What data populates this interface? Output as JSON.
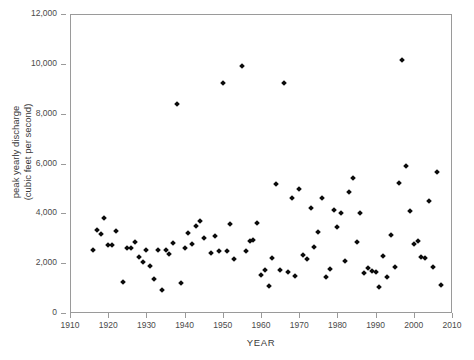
{
  "chart_data": {
    "type": "scatter",
    "title": "",
    "xlabel": "YEAR",
    "ylabel": "peak yearly discharge\n(cubic feet per second)",
    "xlim": [
      1910,
      2010
    ],
    "ylim": [
      0,
      12000
    ],
    "xticks": [
      1910,
      1920,
      1930,
      1940,
      1950,
      1960,
      1970,
      1980,
      1990,
      2000,
      2010
    ],
    "xtick_labels": [
      "1910",
      "1920",
      "1930",
      "1940",
      "1950",
      "1960",
      "1970",
      "1980",
      "1990",
      "2000",
      "2010"
    ],
    "yticks": [
      0,
      2000,
      4000,
      6000,
      8000,
      10000,
      12000
    ],
    "ytick_labels": [
      "0",
      "2,000",
      "4,000",
      "6,000",
      "8,000",
      "10,000",
      "12,000"
    ],
    "grid": false,
    "legend": null,
    "marker": "diamond",
    "marker_color": "#0b0b0b",
    "frame_color": "#9a9a9a",
    "background_color": "#ffffff",
    "series": [
      {
        "name": "peak yearly discharge",
        "x": [
          1916,
          1917,
          1918,
          1919,
          1920,
          1921,
          1922,
          1924,
          1925,
          1926,
          1927,
          1928,
          1929,
          1930,
          1931,
          1932,
          1933,
          1934,
          1935,
          1936,
          1937,
          1938,
          1939,
          1940,
          1941,
          1942,
          1943,
          1944,
          1945,
          1947,
          1948,
          1949,
          1950,
          1951,
          1952,
          1953,
          1955,
          1956,
          1957,
          1958,
          1959,
          1960,
          1961,
          1962,
          1963,
          1964,
          1965,
          1966,
          1967,
          1968,
          1969,
          1970,
          1971,
          1972,
          1973,
          1974,
          1975,
          1976,
          1977,
          1978,
          1979,
          1980,
          1981,
          1982,
          1983,
          1984,
          1985,
          1986,
          1987,
          1988,
          1989,
          1990,
          1991,
          1992,
          1993,
          1994,
          1995,
          1996,
          1997,
          1998,
          1999,
          2000,
          2001,
          2002,
          2003,
          2004,
          2005,
          2006,
          2007
        ],
        "y": [
          2520,
          3330,
          3180,
          3820,
          2720,
          2720,
          3280,
          1240,
          2620,
          2620,
          2830,
          2240,
          2050,
          2520,
          1880,
          1380,
          2540,
          940,
          2540,
          2380,
          2820,
          8400,
          1220,
          2620,
          3230,
          2780,
          3500,
          3700,
          3030,
          2420,
          3100,
          2480,
          9250,
          2480,
          3570,
          2180,
          9900,
          2480,
          2880,
          2920,
          3630,
          1520,
          1720,
          1070,
          2200,
          5180,
          1720,
          9250,
          1650,
          4620,
          1490,
          4960,
          2330,
          2160,
          4220,
          2660,
          3260,
          4600,
          1430,
          1780,
          4150,
          3470,
          4020,
          2090,
          4840,
          5420,
          2830,
          4010,
          1590,
          1800,
          1690,
          1650,
          1060,
          2280,
          1450,
          3130,
          1860,
          5200,
          10150,
          5880,
          4110,
          2780,
          2880,
          2260,
          2220,
          4500,
          1830,
          5640,
          1130
        ]
      }
    ]
  }
}
